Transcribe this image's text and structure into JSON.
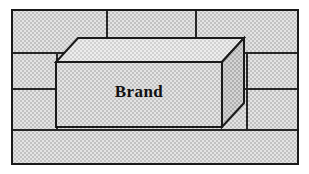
{
  "figure": {
    "background_style": "stippled-brick-wall",
    "box_label": "Brand",
    "canvas": {
      "width": 309,
      "height": 174
    }
  },
  "colors": {
    "page_background": "#ffffff",
    "frame_stroke": "#1a1a1a",
    "mortar_stroke": "#262626",
    "brick_fill": "#d9d9d9",
    "box_front_fill": "#dcdcdc",
    "box_top_fill": "#e6e6e6",
    "box_side_fill": "#c9c9c9",
    "box_stroke": "#1a1a1a",
    "label_color": "#111111"
  },
  "frame": {
    "x": 12,
    "y": 10,
    "width": 286,
    "height": 154,
    "stroke_width": 2
  },
  "wall": {
    "course_lines_y": [
      53,
      89,
      130
    ],
    "joints": [
      {
        "course": 1,
        "x": 107,
        "y1": 10,
        "y2": 53
      },
      {
        "course": 1,
        "x": 196,
        "y1": 10,
        "y2": 53
      },
      {
        "course": 2,
        "x": 57,
        "y1": 53,
        "y2": 89
      },
      {
        "course": 2,
        "x": 247,
        "y1": 53,
        "y2": 89
      },
      {
        "course": 3,
        "x": 57,
        "y1": 89,
        "y2": 130
      },
      {
        "course": 3,
        "x": 247,
        "y1": 89,
        "y2": 130
      }
    ],
    "mortar_stroke_width": 2
  },
  "box": {
    "front": {
      "x1": 56,
      "y1": 62,
      "x2": 222,
      "y2": 127
    },
    "depth_dx": 22,
    "depth_dy": -24,
    "top_face_points": "56,62 78,38 244,38 222,62",
    "right_face_points": "222,62 244,38 244,103 222,127",
    "front_face_points": "56,62 222,62 222,127 56,127",
    "stroke_width": 2
  },
  "label": {
    "text": "Brand",
    "x": 139,
    "y": 97,
    "font_size": 17
  }
}
